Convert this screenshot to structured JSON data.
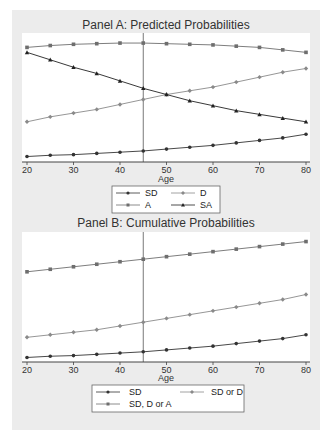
{
  "chart_data": [
    {
      "type": "line",
      "title": "Panel A: Predicted Probabilities",
      "xlabel": "Age",
      "ylabel": "",
      "x": [
        20,
        25,
        30,
        35,
        40,
        45,
        50,
        55,
        60,
        65,
        70,
        75,
        80
      ],
      "xticks": [
        20,
        30,
        40,
        50,
        60,
        70,
        80
      ],
      "xlim": [
        20,
        80
      ],
      "ylim": [
        0,
        1
      ],
      "grid": false,
      "reference_line_x": 45,
      "legend_position": "bottom",
      "series": [
        {
          "name": "SD",
          "marker": "circle",
          "color": "#333333",
          "values": [
            0.02,
            0.03,
            0.035,
            0.045,
            0.055,
            0.065,
            0.08,
            0.095,
            0.11,
            0.13,
            0.15,
            0.17,
            0.2
          ]
        },
        {
          "name": "D",
          "marker": "diamond",
          "color": "#8a8a8a",
          "values": [
            0.3,
            0.34,
            0.37,
            0.4,
            0.44,
            0.48,
            0.52,
            0.55,
            0.58,
            0.62,
            0.66,
            0.7,
            0.73
          ]
        },
        {
          "name": "A",
          "marker": "square",
          "color": "#6e6e6e",
          "values": [
            0.9,
            0.915,
            0.925,
            0.93,
            0.935,
            0.935,
            0.93,
            0.925,
            0.92,
            0.91,
            0.9,
            0.88,
            0.86
          ]
        },
        {
          "name": "SA",
          "marker": "triangle",
          "color": "#222222",
          "values": [
            0.86,
            0.8,
            0.74,
            0.69,
            0.63,
            0.57,
            0.52,
            0.47,
            0.43,
            0.39,
            0.36,
            0.33,
            0.3
          ]
        }
      ]
    },
    {
      "type": "line",
      "title": "Panel B: Cumulative Probabilities",
      "xlabel": "Age",
      "ylabel": "",
      "x": [
        20,
        25,
        30,
        35,
        40,
        45,
        50,
        55,
        60,
        65,
        70,
        75,
        80
      ],
      "xticks": [
        20,
        30,
        40,
        50,
        60,
        70,
        80
      ],
      "xlim": [
        20,
        80
      ],
      "ylim": [
        0,
        1
      ],
      "grid": false,
      "reference_line_x": 45,
      "legend_position": "bottom",
      "series": [
        {
          "name": "SD",
          "marker": "circle",
          "color": "#333333",
          "values": [
            0.02,
            0.03,
            0.035,
            0.045,
            0.055,
            0.065,
            0.08,
            0.095,
            0.11,
            0.13,
            0.15,
            0.17,
            0.2
          ]
        },
        {
          "name": "SD or D",
          "marker": "diamond",
          "color": "#8a8a8a",
          "values": [
            0.18,
            0.2,
            0.22,
            0.24,
            0.27,
            0.3,
            0.33,
            0.36,
            0.39,
            0.42,
            0.45,
            0.48,
            0.52
          ]
        },
        {
          "name": "SD, D or A",
          "marker": "square",
          "color": "#6e6e6e",
          "values": [
            0.7,
            0.72,
            0.74,
            0.76,
            0.78,
            0.8,
            0.82,
            0.84,
            0.86,
            0.88,
            0.9,
            0.92,
            0.94
          ]
        }
      ]
    }
  ],
  "panels": [
    {
      "title": "Panel A: Predicted Probabilities",
      "xlabel": "Age",
      "ticks": [
        "20",
        "30",
        "40",
        "50",
        "60",
        "70",
        "80"
      ],
      "legend": [
        "SD",
        "D",
        "A",
        "SA"
      ]
    },
    {
      "title": "Panel B: Cumulative Probabilities",
      "xlabel": "Age",
      "ticks": [
        "20",
        "30",
        "40",
        "50",
        "60",
        "70",
        "80"
      ],
      "legend": [
        "SD",
        "SD or D",
        "SD, D or A"
      ]
    }
  ]
}
